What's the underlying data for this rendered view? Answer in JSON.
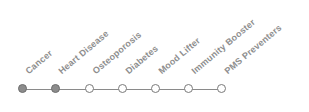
{
  "timeline": {
    "colors": {
      "completed": "#8c8c8c",
      "pending": "#ffffff",
      "line": "#8a8a8a",
      "label": "#8e8e8e"
    },
    "steps": [
      {
        "label": "Cancer",
        "state": "completed"
      },
      {
        "label": "Heart Disease",
        "state": "completed"
      },
      {
        "label": "Osteoporosis",
        "state": "pending"
      },
      {
        "label": "Diabetes",
        "state": "pending"
      },
      {
        "label": "Mood Lifter",
        "state": "pending"
      },
      {
        "label": "Immunity Booster",
        "state": "pending"
      },
      {
        "label": "PMS Preventers",
        "state": "pending"
      }
    ]
  }
}
